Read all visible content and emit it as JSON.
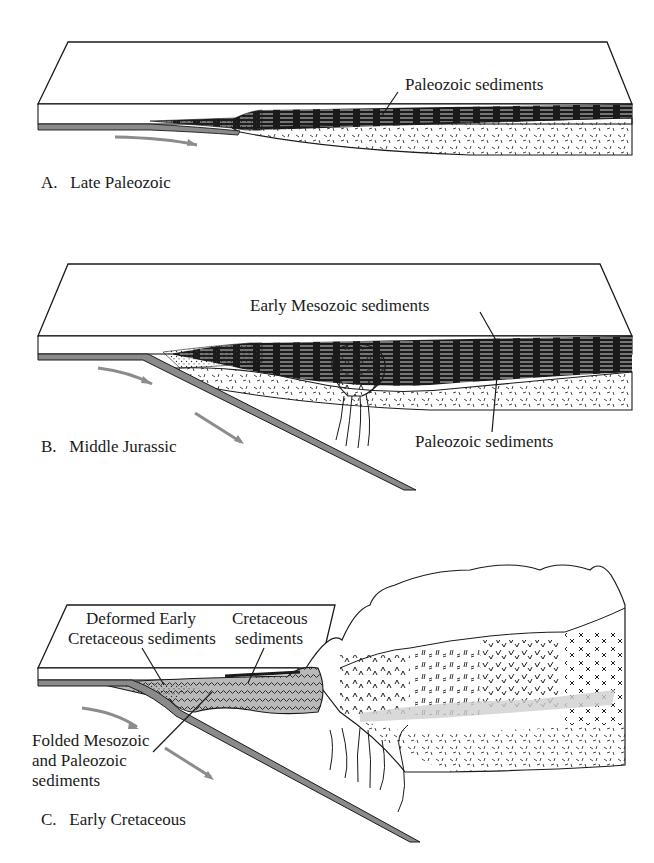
{
  "figure": {
    "panels": [
      {
        "id": "A",
        "caption": "A.   Late Paleozoic",
        "labels": [
          "Paleozoic sediments"
        ]
      },
      {
        "id": "B",
        "caption": "B.   Middle Jurassic",
        "labels": [
          "Early Mesozoic sediments",
          "Paleozoic sediments"
        ]
      },
      {
        "id": "C",
        "caption": "C.   Early Cretaceous",
        "labels": [
          "Deformed Early",
          "Cretaceous sediments",
          "Cretaceous",
          "sediments",
          "Folded Mesozoic",
          "and Paleozoic",
          "sediments"
        ]
      }
    ],
    "colors": {
      "line": "#1a1a1a",
      "slab": "#8a8a8a",
      "arrow": "#8c8c8c",
      "metamorphic_band": "#cfcfcf"
    }
  }
}
